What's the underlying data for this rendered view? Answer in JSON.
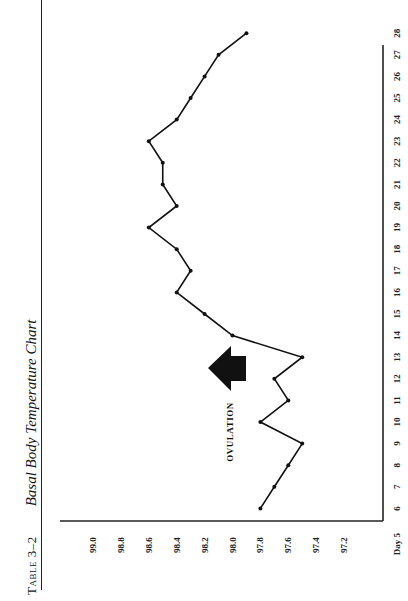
{
  "header": {
    "table_number": "Table 3–2",
    "title": "Basal Body Temperature Chart"
  },
  "annotation": {
    "label": "OVULATION",
    "day": 13.5
  },
  "chart_data": {
    "type": "line",
    "title": "Basal Body Temperature Chart",
    "xlabel": "Day",
    "ylabel": "Temperature (°F)",
    "x": [
      6,
      7,
      8,
      9,
      10,
      11,
      12,
      13,
      14,
      15,
      16,
      17,
      18,
      19,
      20,
      21,
      22,
      23,
      24,
      25,
      26,
      27,
      28
    ],
    "values": [
      97.8,
      97.7,
      97.6,
      97.5,
      97.8,
      97.6,
      97.7,
      97.5,
      98.0,
      98.2,
      98.4,
      98.3,
      98.4,
      98.6,
      98.4,
      98.5,
      98.5,
      98.6,
      98.4,
      98.3,
      98.2,
      98.1,
      97.9
    ],
    "x_ticks": [
      "Day 5",
      "6",
      "7",
      "8",
      "9",
      "10",
      "11",
      "12",
      "13",
      "14",
      "15",
      "16",
      "17",
      "18",
      "19",
      "20",
      "21",
      "22",
      "23",
      "24",
      "25",
      "26",
      "27",
      "28"
    ],
    "y_ticks": [
      "99.0",
      "98.8",
      "98.6",
      "98.4",
      "98.2",
      "98.0",
      "97.8",
      "97.6",
      "97.4",
      "97.2"
    ],
    "ylim": [
      97.2,
      99.0
    ],
    "xlim": [
      5,
      28
    ],
    "grid": false,
    "legend": null,
    "orientation": "rotated 90° (page landscape)",
    "annotations": [
      {
        "text": "OVULATION",
        "type": "arrow",
        "at_day": 13.5
      }
    ]
  }
}
